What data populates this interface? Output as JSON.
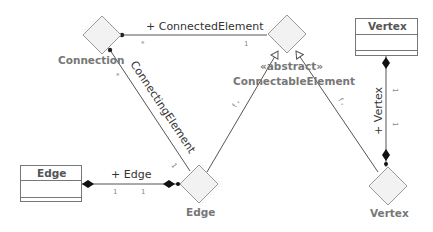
{
  "colors": {
    "line": "#555555",
    "diamond_fill": "#f2f2f2",
    "diamond_stroke": "#999999",
    "class_stroke": "#777777",
    "node_label": "#777777"
  },
  "nodes": {
    "connection": {
      "label": "Connection",
      "shape": "diamond"
    },
    "connectable_element": {
      "stereotype": "«abstract»",
      "label": "ConnectableElement",
      "shape": "diamond"
    },
    "edge_node": {
      "label": "Edge",
      "shape": "diamond"
    },
    "vertex_node": {
      "label": "Vertex",
      "shape": "diamond"
    }
  },
  "classes": {
    "edge_class": {
      "name": "Edge"
    },
    "vertex_class": {
      "name": "Vertex"
    }
  },
  "associations": {
    "connected_element": {
      "label": "+ ConnectedElement",
      "mult_source": "*",
      "mult_target": "1"
    },
    "connecting_element": {
      "label": "ConnectingElement",
      "mult_source": "*",
      "mult_target": "1"
    },
    "edge_assoc": {
      "label": "+ Edge",
      "mult_source": "1",
      "mult_target": "1"
    },
    "vertex_assoc": {
      "label": "+ Vertex",
      "mult_source": "1",
      "mult_target": "1"
    }
  },
  "generalizations": {
    "edge_to_connectable": {
      "label": "f ᵥ"
    },
    "vertex_to_connectable": {
      "label": "f ᵥ"
    }
  }
}
